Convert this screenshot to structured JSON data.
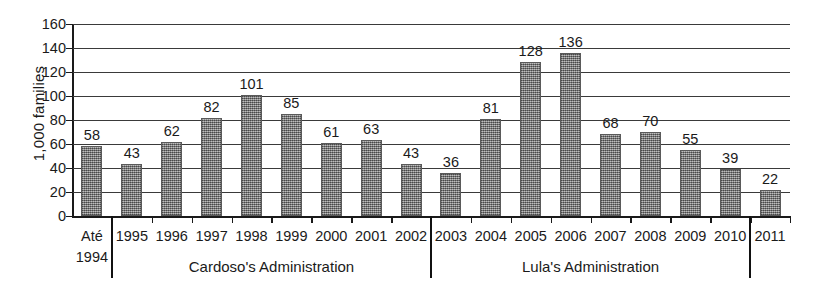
{
  "chart_data": {
    "type": "bar",
    "title": "",
    "subtitle": "",
    "xlabel": "",
    "ylabel": "1,000 families",
    "ylim": [
      0,
      160
    ],
    "ytick_step": 20,
    "yticks": [
      0,
      20,
      40,
      60,
      80,
      100,
      120,
      140,
      160
    ],
    "grid": true,
    "legend": "none",
    "bar_color": "#8d8d8d",
    "axis_color": "#1a1a1a",
    "categories": [
      "Até 1994",
      "1995",
      "1996",
      "1997",
      "1998",
      "1999",
      "2000",
      "2001",
      "2002",
      "2003",
      "2004",
      "2005",
      "2006",
      "2007",
      "2008",
      "2009",
      "2010",
      "2011"
    ],
    "category_lines": [
      [
        "Até",
        "1994"
      ],
      [
        "1995"
      ],
      [
        "1996"
      ],
      [
        "1997"
      ],
      [
        "1998"
      ],
      [
        "1999"
      ],
      [
        "2000"
      ],
      [
        "2001"
      ],
      [
        "2002"
      ],
      [
        "2003"
      ],
      [
        "2004"
      ],
      [
        "2005"
      ],
      [
        "2006"
      ],
      [
        "2007"
      ],
      [
        "2008"
      ],
      [
        "2009"
      ],
      [
        "2010"
      ],
      [
        "2011"
      ]
    ],
    "values": [
      58,
      43,
      62,
      82,
      101,
      85,
      61,
      63,
      43,
      36,
      81,
      128,
      136,
      68,
      70,
      55,
      39,
      22
    ],
    "data_labels": [
      "58",
      "43",
      "62",
      "82",
      "101",
      "85",
      "61",
      "63",
      "43",
      "36",
      "81",
      "128",
      "136",
      "68",
      "70",
      "55",
      "39",
      "22"
    ],
    "annotations": [
      {
        "text": "Cardoso's Administration",
        "spans_categories": [
          "1995",
          "2002"
        ]
      },
      {
        "text": "Lula's Administration",
        "spans_categories": [
          "2003",
          "2010"
        ]
      }
    ],
    "group_separators_after_category": [
      "Até 1994",
      "2002",
      "2010"
    ]
  }
}
